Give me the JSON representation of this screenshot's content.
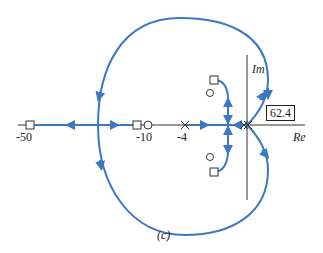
{
  "figure": {
    "caption": "(c)",
    "axis_labels": {
      "real": "Re",
      "imag": "Im"
    },
    "tick_labels": [
      "-50",
      "-10",
      "-4"
    ],
    "annotation_angle": "62.4",
    "colors": {
      "locus": "#3a78c2",
      "axis": "#333333"
    }
  }
}
